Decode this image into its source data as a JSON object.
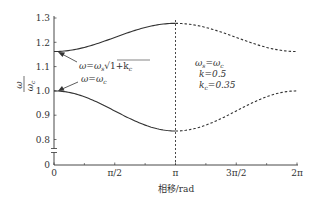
{
  "chart_data": {
    "type": "line",
    "title": "",
    "xlabel": "相移/rad",
    "ylabel": "ω/ω_c",
    "ylabel_parts": {
      "num": "ω",
      "den": "ω",
      "den_sub": "c"
    },
    "xlim": [
      0,
      6.2832
    ],
    "ylim_display": [
      0.8,
      1.3
    ],
    "y_axis_break": true,
    "grid": false,
    "x_ticks": [
      {
        "value": 0,
        "label": "0"
      },
      {
        "value": 1.5708,
        "label": "π/2"
      },
      {
        "value": 3.1416,
        "label": "π"
      },
      {
        "value": 4.7124,
        "label": "3π/2"
      },
      {
        "value": 6.2832,
        "label": "2π"
      }
    ],
    "x_minor_ticks": [
      0.7854,
      2.3562,
      3.927,
      5.4978
    ],
    "y_ticks": [
      {
        "value": 1.3,
        "label": "1.3"
      },
      {
        "value": 1.2,
        "label": "1.2"
      },
      {
        "value": 1.1,
        "label": "1.1"
      },
      {
        "value": 1.0,
        "label": "1.0"
      },
      {
        "value": 0.9,
        "label": "0.9"
      },
      {
        "value": 0.8,
        "label": "0.8"
      },
      {
        "value": 0,
        "label": "0"
      }
    ],
    "series": [
      {
        "name": "upper branch (solid 0–π, dashed π–2π)",
        "x": [
          0,
          0.785,
          1.571,
          2.356,
          3.142,
          3.927,
          4.712,
          5.498,
          6.283
        ],
        "values": [
          1.162,
          1.18,
          1.22,
          1.26,
          1.278,
          1.26,
          1.22,
          1.18,
          1.162
        ]
      },
      {
        "name": "lower branch (solid 0–π, dashed π–2π)",
        "x": [
          0,
          0.785,
          1.571,
          2.356,
          3.142,
          3.927,
          4.712,
          5.498,
          6.283
        ],
        "values": [
          1.0,
          0.98,
          0.925,
          0.865,
          0.835,
          0.865,
          0.925,
          0.98,
          1.0
        ]
      }
    ],
    "vertical_dashed_line_at": 3.1416,
    "annotations": [
      {
        "text": "ω=ω_s√(1+k_c)",
        "parts": [
          "ω",
          "=",
          "ω",
          "s",
          "√",
          "1+k",
          "c"
        ],
        "points_to": [
          0,
          1.162
        ]
      },
      {
        "text": "ω=ω_c",
        "points_to": [
          0,
          1.0
        ]
      },
      {
        "text_lines": [
          "ω_s=ω_c",
          "k=0.5",
          "k_c=0.35"
        ]
      }
    ]
  },
  "labels": {
    "x_axis": "相移/rad",
    "y_num": "ω",
    "y_den": "ω",
    "y_den_sub": "c",
    "anno1_lhs": "ω",
    "anno1_eq": "=",
    "anno1_w": "ω",
    "anno1_sub": "s",
    "anno1_rad": "1+k",
    "anno1_rad_sub": "c",
    "anno2_lhs": "ω=ω",
    "anno2_sub": "c",
    "params_l1": "ω",
    "params_l1_sub": "s",
    "params_l1_rest": "=ω",
    "params_l1_sub2": "c",
    "params_l2": "k=0.5",
    "params_l3": "k",
    "params_l3_sub": "c",
    "params_l3_rest": "=0.35"
  },
  "colors": {
    "line": "#333333",
    "axis": "#333333",
    "text": "#333333"
  }
}
